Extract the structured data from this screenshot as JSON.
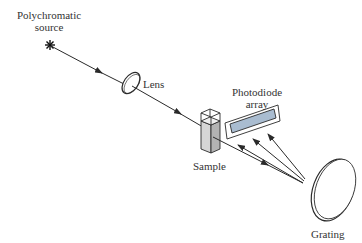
{
  "diagram": {
    "title": "",
    "labels": {
      "source_line1": "Polychromatic",
      "source_line2": "source",
      "lens": "Lens",
      "sample": "Sample",
      "array_line1": "Photodiode",
      "array_line2": "array",
      "grating": "Grating"
    },
    "colors": {
      "line": "#2a2a2a",
      "sample_fill": "#c8c8c8",
      "sample_side": "#a8a8a8",
      "detector_fill": "#a9bcd0",
      "text": "#333333"
    }
  }
}
